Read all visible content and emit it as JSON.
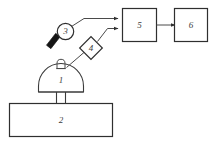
{
  "diagram": {
    "background_color": "#ffffff",
    "line_color": "#3a3a3a",
    "label_color": "#3c3c3c",
    "solid_fill_color": "#151515",
    "components": [
      {
        "id": "1",
        "label": "1",
        "shape": "dome",
        "role": "dome-chamber",
        "description": "Hemispherical dome with top nub and two support legs"
      },
      {
        "id": "2",
        "label": "2",
        "shape": "rectangle",
        "role": "base-platform",
        "description": "Large horizontal base rectangle"
      },
      {
        "id": "3",
        "label": "3",
        "shape": "circle",
        "role": "sensor-head",
        "description": "Circle with solid black angled bar at lower left"
      },
      {
        "id": "4",
        "label": "4",
        "shape": "diamond",
        "role": "optical-element",
        "description": "Diamond placed on the diagonal signal path"
      },
      {
        "id": "5",
        "label": "5",
        "shape": "rectangle",
        "role": "processing-unit",
        "description": "Box receiving two arrow inputs from the left"
      },
      {
        "id": "6",
        "label": "6",
        "shape": "rectangle",
        "role": "output-unit",
        "description": "Box receiving one arrow input from box 5"
      }
    ],
    "connections": [
      {
        "from": "3",
        "to": "5",
        "style": "arrow",
        "path": "elbow-up-right"
      },
      {
        "from": "4",
        "to": "5",
        "style": "arrow",
        "path": "elbow-up-right"
      },
      {
        "from": "5",
        "to": "6",
        "style": "arrow",
        "path": "horizontal"
      },
      {
        "from": "1",
        "to": "4",
        "style": "line",
        "path": "diagonal"
      },
      {
        "from": "1",
        "to": "2",
        "style": "legs",
        "path": "vertical-pair"
      }
    ]
  }
}
